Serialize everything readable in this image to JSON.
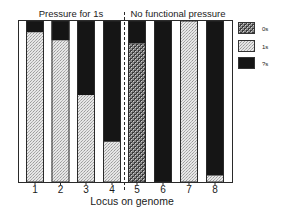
{
  "chart_data": {
    "type": "bar",
    "stacked": true,
    "normalized": true,
    "title": "",
    "xlabel": "Locus on genome",
    "ylabel": "",
    "ylim": [
      0,
      100
    ],
    "grid": false,
    "legend_position": "right",
    "categories": [
      "1",
      "2",
      "3",
      "4",
      "5",
      "6",
      "7",
      "8"
    ],
    "group_labels": [
      {
        "label": "Pressure for 1s",
        "categories": [
          "1",
          "2",
          "3",
          "4"
        ]
      },
      {
        "label": "No functional pressure",
        "categories": [
          "5",
          "6",
          "7",
          "8"
        ]
      }
    ],
    "series": [
      {
        "name": "0s",
        "pattern": "dark-checker",
        "color": "#6a6a6a",
        "values": [
          0,
          0,
          0,
          0,
          86,
          0,
          0,
          0
        ]
      },
      {
        "name": "1s",
        "pattern": "light-stipple",
        "color": "#d9d9d9",
        "values": [
          93,
          88,
          54,
          25,
          0,
          0,
          100,
          4
        ]
      },
      {
        "name": "?s",
        "pattern": "solid",
        "color": "#151515",
        "values": [
          7,
          12,
          46,
          75,
          14,
          100,
          0,
          96
        ]
      }
    ]
  },
  "labels": {
    "group_left": "Pressure for 1s",
    "group_right": "No functional pressure",
    "xlabel": "Locus on genome",
    "ticks": [
      "1",
      "2",
      "3",
      "4",
      "5",
      "6",
      "7",
      "8"
    ],
    "legend": [
      "0s",
      "1s",
      "?s"
    ]
  }
}
